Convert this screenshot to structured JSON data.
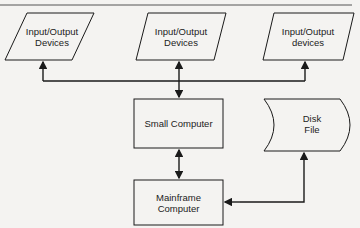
{
  "diagram": {
    "nodes": [
      {
        "id": "io_left",
        "shape": "parallelogram",
        "label": "Input/Output\nDevices"
      },
      {
        "id": "io_middle",
        "shape": "parallelogram",
        "label": "Input/Output\nDevices"
      },
      {
        "id": "io_right",
        "shape": "parallelogram",
        "label": "Input/Output\ndevices"
      },
      {
        "id": "small_computer",
        "shape": "rectangle",
        "label": "Small Computer"
      },
      {
        "id": "disk_file",
        "shape": "stored-data",
        "label": "Disk\nFile"
      },
      {
        "id": "mainframe",
        "shape": "rectangle",
        "label": "Mainframe\nComputer"
      }
    ],
    "edges": [
      {
        "from": "small_computer",
        "to": "io_left",
        "arrow": "single"
      },
      {
        "from": "small_computer",
        "to": "io_middle",
        "arrow": "double"
      },
      {
        "from": "small_computer",
        "to": "io_right",
        "arrow": "single"
      },
      {
        "from": "small_computer",
        "to": "mainframe",
        "arrow": "double"
      },
      {
        "from": "disk_file",
        "to": "mainframe",
        "arrow": "double"
      }
    ],
    "colors": {
      "line": "#1a1a1a",
      "background": "#f4f3f1",
      "text": "#222222"
    }
  }
}
